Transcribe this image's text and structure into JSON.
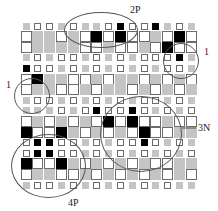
{
  "figure": {
    "type": "grid-pattern-diagram",
    "legend_colors": {
      "white": "#ffffff",
      "gray": "#c4c4c4",
      "black": "#000000"
    },
    "grid": {
      "cols": 15,
      "row_sizes": [
        "S",
        "L",
        "L",
        "S",
        "S",
        "L",
        "L",
        "S",
        "S",
        "L",
        "L",
        "S",
        "S",
        "L",
        "L",
        "S"
      ],
      "rows": [
        "gwwgwggwbwwbgwg",
        "wggwgwbwbwwgwbw",
        "wggggwwgwwgwbww",
        "gwgwwgwgwgwwwbg",
        "bwwgwgwgwgwgwwg",
        "wbggwwgwggwgwgw",
        "wggwwgwggwgwgwg",
        "gwwgwgwgwgwwgwg",
        "gggwgwbwwbwgwgw",
        "wgwgwgwbwbwwgww",
        "bwwbgwgwgwbwwgg",
        "wbbwwgwgwwbwgwg",
        "wbbwwgwgwgwgwgw",
        "bwwbgwgwgwgwwgg",
        "wggwwgwgwgwgwgw",
        "gwwgwgwgwgwgwgg"
      ]
    },
    "annotations": [
      {
        "label": "2P",
        "target": "top cluster"
      },
      {
        "label": "1",
        "target": "upper-right cluster"
      },
      {
        "label": "1",
        "target": "left cluster"
      },
      {
        "label": "3N",
        "target": "center-right cluster"
      },
      {
        "label": "4P",
        "target": "lower-left cluster"
      }
    ]
  }
}
